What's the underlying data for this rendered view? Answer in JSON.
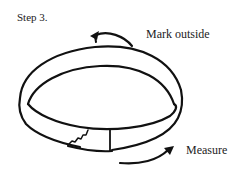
{
  "figure": {
    "step_title": "Step 3.",
    "annotations": {
      "top": "Mark outside",
      "bottom": "Measure"
    },
    "icons": {
      "top_arrow": "curved-arrow-counterclockwise-icon",
      "bottom_arrow": "curved-arrow-right-icon"
    },
    "colors": {
      "ink": "#111111",
      "background": "#ffffff"
    }
  }
}
